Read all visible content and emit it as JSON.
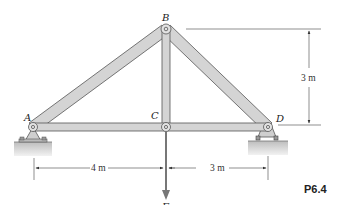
{
  "figure": {
    "id_label": "P6.4"
  },
  "joints": [
    {
      "name": "A",
      "x": 33,
      "y": 127
    },
    {
      "name": "B",
      "x": 166,
      "y": 29
    },
    {
      "name": "C",
      "x": 166,
      "y": 127
    },
    {
      "name": "D",
      "x": 268,
      "y": 127
    }
  ],
  "members": [
    {
      "name": "AB",
      "from": "A",
      "to": "B"
    },
    {
      "name": "BC",
      "from": "B",
      "to": "C"
    },
    {
      "name": "BD",
      "from": "B",
      "to": "D"
    },
    {
      "name": "AC",
      "from": "A",
      "to": "C"
    },
    {
      "name": "CD",
      "from": "C",
      "to": "D"
    }
  ],
  "labels": {
    "A": "A",
    "B": "B",
    "C": "C",
    "D": "D",
    "F": "F"
  },
  "dimensions": {
    "height": "3 m",
    "AC_span": "4 m",
    "CD_span": "3 m"
  },
  "supports": {
    "A": "pin",
    "D": "roller"
  },
  "load": {
    "label": "F",
    "at": "C",
    "direction": "down"
  },
  "colors": {
    "member_fill": "#d4d4d4",
    "member_stroke": "#555555",
    "ground": "#cfcfcf",
    "line": "#444444"
  }
}
